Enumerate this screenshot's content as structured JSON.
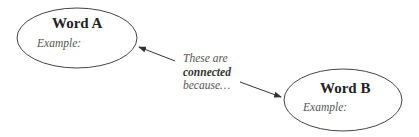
{
  "diagram": {
    "type": "concept-connection",
    "nodes": [
      {
        "id": "A",
        "title": "Word A",
        "example_label": "Example:"
      },
      {
        "id": "B",
        "title": "Word B",
        "example_label": "Example:"
      }
    ],
    "connector": {
      "line1": "These are",
      "line2": "connected",
      "line3": "because…"
    },
    "edges": [
      {
        "from": "connector",
        "to": "A"
      },
      {
        "from": "connector",
        "to": "B"
      }
    ],
    "colors": {
      "stroke": "#444444",
      "background": "#ffffff"
    }
  }
}
